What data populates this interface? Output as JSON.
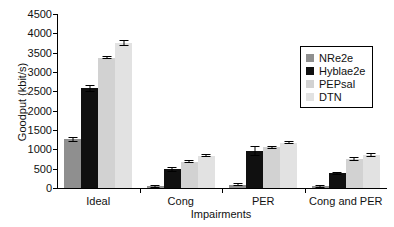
{
  "chart_data": {
    "type": "bar",
    "title": "",
    "xlabel": "Impairments",
    "ylabel": "Goodput (kbit/s)",
    "categories": [
      "Ideal",
      "Cong",
      "PER",
      "Cong and PER"
    ],
    "ylim": [
      0,
      4500
    ],
    "yticks": [
      0,
      500,
      1000,
      1500,
      2000,
      2500,
      3000,
      3500,
      4000,
      4500
    ],
    "grid": false,
    "legend_position": "upper right",
    "series": [
      {
        "name": "NRe2e",
        "color": "#8f8f8f",
        "values": [
          1260,
          50,
          90,
          50
        ],
        "errors": [
          70,
          25,
          30,
          20
        ]
      },
      {
        "name": "Hyblae2e",
        "color": "#101010",
        "values": [
          2580,
          480,
          960,
          380
        ],
        "errors": [
          95,
          75,
          130,
          40
        ]
      },
      {
        "name": "PEPsal",
        "color": "#d2d2d2",
        "values": [
          3370,
          680,
          1050,
          750
        ],
        "errors": [
          30,
          18,
          20,
          45
        ]
      },
      {
        "name": "DTN",
        "color": "#e2e2e2",
        "values": [
          3760,
          840,
          1170,
          850
        ],
        "errors": [
          75,
          22,
          18,
          45
        ]
      }
    ]
  }
}
